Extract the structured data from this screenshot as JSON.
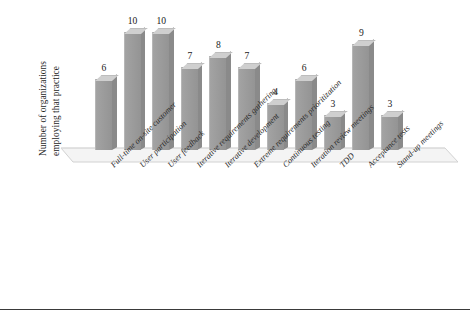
{
  "chart_data": {
    "type": "bar",
    "title": "",
    "subtitle": "",
    "xlabel": "",
    "ylabel": "Number of organizations employing that practice",
    "ylabel_lines": [
      "Number of organizations",
      "employing that practice"
    ],
    "ylim": [
      0,
      10
    ],
    "grid": false,
    "legend": false,
    "style": "3d-bar",
    "bar_color": "#9a9a9a",
    "bar_top_color": "#cfcfcf",
    "bar_side_color": "#8a8a8a",
    "categories": [
      "Full-time on-site customer",
      "User participation",
      "User feedback",
      "Iterative requirements gathering",
      "Iterative development",
      "Extreme requirements prioritization",
      "Continuous testing",
      "Iteration review meetings",
      "TDD",
      "Acceptance tests",
      "Stand-up meetings"
    ],
    "values": [
      6,
      10,
      10,
      7,
      8,
      7,
      4,
      6,
      3,
      9,
      3
    ],
    "value_labels": [
      "6",
      "10",
      "10",
      "7",
      "8",
      "7",
      "4",
      "6",
      "3",
      "9",
      "3"
    ]
  },
  "axis": {
    "baseline_color": "#d8d8d8",
    "rule_color": "#3a3a3a"
  }
}
